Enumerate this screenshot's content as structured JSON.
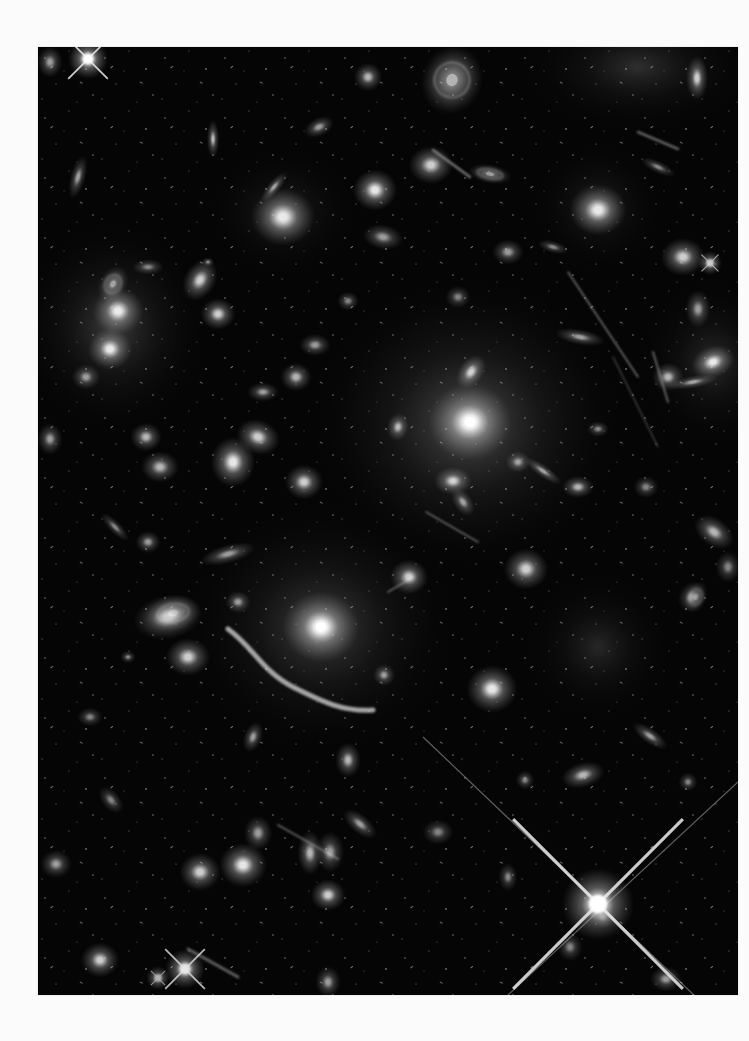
{
  "page": {
    "background": "#fbfbfb"
  },
  "image": {
    "subject": "deep-field galaxy cluster with gravitational lensing arcs",
    "frame": {
      "x": 38,
      "y": 47,
      "width": 700,
      "height": 948,
      "background": "#050505"
    },
    "colors": {
      "glow": "#ffffff",
      "halo": "#d9d9d9",
      "sky": "#050505"
    },
    "cluster_halos": [
      {
        "x": 430,
        "y": 376,
        "rx": 150,
        "ry": 140,
        "o": 0.4
      },
      {
        "x": 283,
        "y": 580,
        "rx": 130,
        "ry": 120,
        "o": 0.32
      },
      {
        "x": 75,
        "y": 280,
        "rx": 90,
        "ry": 100,
        "o": 0.3
      },
      {
        "x": 560,
        "y": 600,
        "rx": 70,
        "ry": 70,
        "o": 0.18
      },
      {
        "x": 600,
        "y": 20,
        "rx": 110,
        "ry": 60,
        "o": 0.22
      },
      {
        "x": 675,
        "y": 315,
        "rx": 70,
        "ry": 80,
        "o": 0.2
      },
      {
        "x": 245,
        "y": 165,
        "rx": 70,
        "ry": 60,
        "o": 0.18
      },
      {
        "x": 560,
        "y": 160,
        "rx": 60,
        "ry": 60,
        "o": 0.18
      }
    ],
    "galaxies": [
      {
        "x": 432,
        "y": 375,
        "rx": 26,
        "ry": 24,
        "rot": 0,
        "b": 1.0
      },
      {
        "x": 433,
        "y": 325,
        "rx": 12,
        "ry": 8,
        "rot": -55,
        "b": 0.8
      },
      {
        "x": 415,
        "y": 434,
        "rx": 12,
        "ry": 9,
        "rot": 0,
        "b": 0.8
      },
      {
        "x": 360,
        "y": 380,
        "rx": 7,
        "ry": 9,
        "rot": 10,
        "b": 0.7
      },
      {
        "x": 480,
        "y": 415,
        "rx": 8,
        "ry": 7,
        "rot": 0,
        "b": 0.6
      },
      {
        "x": 505,
        "y": 424,
        "rx": 14,
        "ry": 4,
        "rot": 35,
        "b": 0.6
      },
      {
        "x": 425,
        "y": 455,
        "rx": 6,
        "ry": 10,
        "rot": -35,
        "b": 0.6
      },
      {
        "x": 540,
        "y": 440,
        "rx": 10,
        "ry": 7,
        "rot": 0,
        "b": 0.7
      },
      {
        "x": 542,
        "y": 290,
        "rx": 16,
        "ry": 5,
        "rot": 10,
        "b": 0.6
      },
      {
        "x": 283,
        "y": 580,
        "rx": 24,
        "ry": 22,
        "rot": 0,
        "b": 1.0
      },
      {
        "x": 130,
        "y": 570,
        "rx": 22,
        "ry": 14,
        "rot": -10,
        "b": 0.7
      },
      {
        "x": 150,
        "y": 610,
        "rx": 14,
        "ry": 12,
        "rot": 0,
        "b": 0.8
      },
      {
        "x": 346,
        "y": 628,
        "rx": 7,
        "ry": 7,
        "rot": 0,
        "b": 0.6
      },
      {
        "x": 454,
        "y": 642,
        "rx": 16,
        "ry": 15,
        "rot": 0,
        "b": 0.9
      },
      {
        "x": 80,
        "y": 264,
        "rx": 16,
        "ry": 15,
        "rot": 0,
        "b": 0.9
      },
      {
        "x": 72,
        "y": 302,
        "rx": 14,
        "ry": 13,
        "rot": 0,
        "b": 0.9
      },
      {
        "x": 162,
        "y": 233,
        "rx": 14,
        "ry": 10,
        "rot": -60,
        "b": 0.8
      },
      {
        "x": 180,
        "y": 267,
        "rx": 11,
        "ry": 10,
        "rot": 0,
        "b": 0.8
      },
      {
        "x": 245,
        "y": 170,
        "rx": 20,
        "ry": 18,
        "rot": 0,
        "b": 0.9
      },
      {
        "x": 337,
        "y": 143,
        "rx": 14,
        "ry": 13,
        "rot": 0,
        "b": 0.9
      },
      {
        "x": 393,
        "y": 118,
        "rx": 14,
        "ry": 12,
        "rot": 0,
        "b": 0.8
      },
      {
        "x": 560,
        "y": 163,
        "rx": 18,
        "ry": 16,
        "rot": 0,
        "b": 0.9
      },
      {
        "x": 645,
        "y": 210,
        "rx": 14,
        "ry": 12,
        "rot": 0,
        "b": 0.8
      },
      {
        "x": 675,
        "y": 315,
        "rx": 14,
        "ry": 10,
        "rot": -20,
        "b": 0.9
      },
      {
        "x": 630,
        "y": 330,
        "rx": 10,
        "ry": 9,
        "rot": 0,
        "b": 0.7
      },
      {
        "x": 655,
        "y": 335,
        "rx": 16,
        "ry": 4,
        "rot": -10,
        "b": 0.6
      },
      {
        "x": 659,
        "y": 31,
        "rx": 7,
        "ry": 14,
        "rot": 0,
        "b": 0.8
      },
      {
        "x": 608,
        "y": 440,
        "rx": 8,
        "ry": 7,
        "rot": 0,
        "b": 0.5
      },
      {
        "x": 676,
        "y": 485,
        "rx": 14,
        "ry": 9,
        "rot": 35,
        "b": 0.7
      },
      {
        "x": 653,
        "y": 550,
        "rx": 8,
        "ry": 10,
        "rot": 20,
        "b": 0.5
      },
      {
        "x": 488,
        "y": 522,
        "rx": 14,
        "ry": 13,
        "rot": 0,
        "b": 0.8
      },
      {
        "x": 371,
        "y": 530,
        "rx": 12,
        "ry": 11,
        "rot": 0,
        "b": 0.8
      },
      {
        "x": 345,
        "y": 190,
        "rx": 13,
        "ry": 8,
        "rot": 10,
        "b": 0.6
      },
      {
        "x": 281,
        "y": 80,
        "rx": 10,
        "ry": 6,
        "rot": -25,
        "b": 0.6
      },
      {
        "x": 236,
        "y": 140,
        "rx": 12,
        "ry": 4,
        "rot": -50,
        "b": 0.6
      },
      {
        "x": 175,
        "y": 92,
        "rx": 4,
        "ry": 12,
        "rot": 0,
        "b": 0.7
      },
      {
        "x": 40,
        "y": 130,
        "rx": 5,
        "ry": 14,
        "rot": 15,
        "b": 0.6
      },
      {
        "x": 12,
        "y": 15,
        "rx": 8,
        "ry": 10,
        "rot": 0,
        "b": 0.6
      },
      {
        "x": 330,
        "y": 30,
        "rx": 9,
        "ry": 9,
        "rot": 0,
        "b": 0.7
      },
      {
        "x": 220,
        "y": 390,
        "rx": 14,
        "ry": 11,
        "rot": 20,
        "b": 0.8
      },
      {
        "x": 195,
        "y": 415,
        "rx": 14,
        "ry": 16,
        "rot": 0,
        "b": 0.9
      },
      {
        "x": 266,
        "y": 435,
        "rx": 12,
        "ry": 11,
        "rot": 0,
        "b": 0.8
      },
      {
        "x": 258,
        "y": 330,
        "rx": 10,
        "ry": 9,
        "rot": 0,
        "b": 0.7
      },
      {
        "x": 225,
        "y": 345,
        "rx": 10,
        "ry": 6,
        "rot": 0,
        "b": 0.6
      },
      {
        "x": 277,
        "y": 298,
        "rx": 10,
        "ry": 7,
        "rot": 0,
        "b": 0.6
      },
      {
        "x": 108,
        "y": 390,
        "rx": 10,
        "ry": 9,
        "rot": 0,
        "b": 0.7
      },
      {
        "x": 122,
        "y": 420,
        "rx": 12,
        "ry": 10,
        "rot": 0,
        "b": 0.7
      },
      {
        "x": 48,
        "y": 330,
        "rx": 9,
        "ry": 8,
        "rot": 0,
        "b": 0.6
      },
      {
        "x": 12,
        "y": 392,
        "rx": 8,
        "ry": 10,
        "rot": 0,
        "b": 0.6
      },
      {
        "x": 110,
        "y": 495,
        "rx": 8,
        "ry": 7,
        "rot": 0,
        "b": 0.6
      },
      {
        "x": 190,
        "y": 507,
        "rx": 18,
        "ry": 6,
        "rot": -15,
        "b": 0.6
      },
      {
        "x": 200,
        "y": 555,
        "rx": 8,
        "ry": 7,
        "rot": 0,
        "b": 0.6
      },
      {
        "x": 77,
        "y": 480,
        "rx": 12,
        "ry": 4,
        "rot": 45,
        "b": 0.5
      },
      {
        "x": 52,
        "y": 670,
        "rx": 8,
        "ry": 6,
        "rot": 0,
        "b": 0.5
      },
      {
        "x": 73,
        "y": 753,
        "rx": 10,
        "ry": 6,
        "rot": 50,
        "b": 0.5
      },
      {
        "x": 220,
        "y": 786,
        "rx": 9,
        "ry": 11,
        "rot": 0,
        "b": 0.6
      },
      {
        "x": 272,
        "y": 806,
        "rx": 8,
        "ry": 14,
        "rot": 0,
        "b": 0.7
      },
      {
        "x": 322,
        "y": 777,
        "rx": 13,
        "ry": 6,
        "rot": 40,
        "b": 0.6
      },
      {
        "x": 205,
        "y": 818,
        "rx": 15,
        "ry": 14,
        "rot": 0,
        "b": 0.9
      },
      {
        "x": 162,
        "y": 825,
        "rx": 13,
        "ry": 12,
        "rot": 0,
        "b": 0.8
      },
      {
        "x": 290,
        "y": 848,
        "rx": 11,
        "ry": 10,
        "rot": 0,
        "b": 0.8
      },
      {
        "x": 292,
        "y": 805,
        "rx": 9,
        "ry": 13,
        "rot": 0,
        "b": 0.6
      },
      {
        "x": 18,
        "y": 817,
        "rx": 10,
        "ry": 9,
        "rot": 0,
        "b": 0.6
      },
      {
        "x": 62,
        "y": 913,
        "rx": 12,
        "ry": 11,
        "rot": 0,
        "b": 0.8
      },
      {
        "x": 290,
        "y": 935,
        "rx": 8,
        "ry": 10,
        "rot": 0,
        "b": 0.6
      },
      {
        "x": 215,
        "y": 690,
        "rx": 6,
        "ry": 10,
        "rot": 20,
        "b": 0.6
      },
      {
        "x": 310,
        "y": 713,
        "rx": 8,
        "ry": 11,
        "rot": 0,
        "b": 0.7
      },
      {
        "x": 545,
        "y": 728,
        "rx": 14,
        "ry": 8,
        "rot": -15,
        "b": 0.7
      },
      {
        "x": 612,
        "y": 689,
        "rx": 13,
        "ry": 5,
        "rot": 35,
        "b": 0.6
      },
      {
        "x": 487,
        "y": 733,
        "rx": 6,
        "ry": 6,
        "rot": 0,
        "b": 0.5
      },
      {
        "x": 565,
        "y": 870,
        "rx": 8,
        "ry": 7,
        "rot": 0,
        "b": 0.5
      },
      {
        "x": 532,
        "y": 900,
        "rx": 8,
        "ry": 9,
        "rot": 0,
        "b": 0.5
      },
      {
        "x": 628,
        "y": 932,
        "rx": 10,
        "ry": 8,
        "rot": 0,
        "b": 0.6
      },
      {
        "x": 400,
        "y": 785,
        "rx": 10,
        "ry": 8,
        "rot": 0,
        "b": 0.5
      },
      {
        "x": 90,
        "y": 610,
        "rx": 5,
        "ry": 4,
        "rot": 0,
        "b": 0.5
      },
      {
        "x": 650,
        "y": 735,
        "rx": 6,
        "ry": 6,
        "rot": 0,
        "b": 0.5
      },
      {
        "x": 690,
        "y": 520,
        "rx": 8,
        "ry": 10,
        "rot": 0,
        "b": 0.5
      },
      {
        "x": 470,
        "y": 830,
        "rx": 6,
        "ry": 9,
        "rot": 0,
        "b": 0.5
      },
      {
        "x": 470,
        "y": 205,
        "rx": 10,
        "ry": 8,
        "rot": 0,
        "b": 0.6
      },
      {
        "x": 420,
        "y": 250,
        "rx": 8,
        "ry": 7,
        "rot": 0,
        "b": 0.5
      },
      {
        "x": 515,
        "y": 200,
        "rx": 10,
        "ry": 4,
        "rot": 15,
        "b": 0.5
      },
      {
        "x": 620,
        "y": 120,
        "rx": 12,
        "ry": 4,
        "rot": 25,
        "b": 0.5
      },
      {
        "x": 660,
        "y": 262,
        "rx": 8,
        "ry": 12,
        "rot": 0,
        "b": 0.6
      },
      {
        "x": 170,
        "y": 215,
        "rx": 4,
        "ry": 3,
        "rot": 0,
        "b": 0.5
      },
      {
        "x": 310,
        "y": 254,
        "rx": 7,
        "ry": 6,
        "rot": 0,
        "b": 0.5
      },
      {
        "x": 560,
        "y": 382,
        "rx": 7,
        "ry": 5,
        "rot": 0,
        "b": 0.5
      },
      {
        "x": 110,
        "y": 220,
        "rx": 10,
        "ry": 5,
        "rot": 0,
        "b": 0.5
      }
    ],
    "spirals": [
      {
        "x": 414,
        "y": 33,
        "rx": 22,
        "ry": 25,
        "rot": 20,
        "b": 0.7
      },
      {
        "x": 75,
        "y": 237,
        "rx": 10,
        "ry": 14,
        "rot": 30,
        "b": 0.6
      },
      {
        "x": 135,
        "y": 566,
        "rx": 20,
        "ry": 13,
        "rot": -10,
        "b": 0.6
      },
      {
        "x": 452,
        "y": 127,
        "rx": 16,
        "ry": 7,
        "rot": 10,
        "b": 0.6
      },
      {
        "x": 658,
        "y": 550,
        "rx": 8,
        "ry": 12,
        "rot": 20,
        "b": 0.5
      }
    ],
    "streaks": [
      {
        "x1": 530,
        "y1": 225,
        "x2": 600,
        "y2": 330,
        "w": 1.4,
        "o": 0.55
      },
      {
        "x1": 575,
        "y1": 310,
        "x2": 620,
        "y2": 400,
        "w": 1.2,
        "o": 0.35
      },
      {
        "x1": 388,
        "y1": 465,
        "x2": 440,
        "y2": 495,
        "w": 1.6,
        "o": 0.45
      },
      {
        "x1": 395,
        "y1": 103,
        "x2": 432,
        "y2": 130,
        "w": 2.5,
        "o": 0.55
      },
      {
        "x1": 240,
        "y1": 778,
        "x2": 300,
        "y2": 812,
        "w": 2.0,
        "o": 0.45
      },
      {
        "x1": 350,
        "y1": 545,
        "x2": 375,
        "y2": 530,
        "w": 1.5,
        "o": 0.45
      },
      {
        "x1": 150,
        "y1": 902,
        "x2": 200,
        "y2": 930,
        "w": 3.0,
        "o": 0.45
      },
      {
        "x1": 600,
        "y1": 85,
        "x2": 640,
        "y2": 102,
        "w": 2.5,
        "o": 0.45
      },
      {
        "x1": 615,
        "y1": 305,
        "x2": 630,
        "y2": 355,
        "w": 2.0,
        "o": 0.45
      }
    ],
    "dragon_arc": {
      "path": "M 190 582 C 215 600, 225 625, 255 640 S 305 665, 335 663",
      "width": 5,
      "opacity": 0.75
    },
    "stars": [
      {
        "x": 50,
        "y": 12,
        "r": 5,
        "spike": 28,
        "b": 1.0
      },
      {
        "x": 560,
        "y": 857,
        "r": 9,
        "spike": 120,
        "b": 1.0
      },
      {
        "x": 147,
        "y": 922,
        "r": 5,
        "spike": 28,
        "b": 0.9
      },
      {
        "x": 672,
        "y": 216,
        "r": 3,
        "spike": 12,
        "b": 0.8
      },
      {
        "x": 120,
        "y": 931,
        "r": 3,
        "spike": 10,
        "b": 0.7
      }
    ],
    "long_spikes": [
      {
        "x1": 385,
        "y1": 690,
        "x2": 700,
        "y2": 990,
        "w": 1.2,
        "o": 0.45
      },
      {
        "x1": 470,
        "y1": 948,
        "x2": 700,
        "y2": 735,
        "w": 1.2,
        "o": 0.45
      }
    ]
  }
}
